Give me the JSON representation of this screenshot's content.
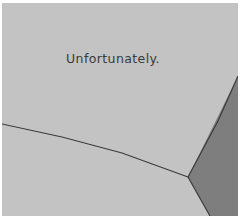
{
  "panel": {
    "caption": "Unfortunately.",
    "colors": {
      "background": "#ffffff",
      "floor": "#c3c3c3",
      "wall": "#7e7e7e",
      "line": "#3c3c3c",
      "text": "#3a3a3a"
    }
  }
}
